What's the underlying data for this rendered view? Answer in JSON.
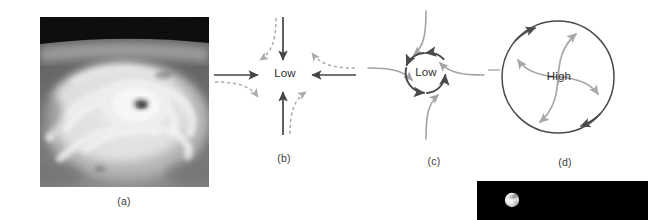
{
  "figure": {
    "background": "#ffffff",
    "width": 648,
    "height": 220
  },
  "panels": [
    {
      "id": "a",
      "caption": "(a)",
      "kind": "satellite-photograph",
      "description": "Grayscale satellite photograph of a mature hurricane with visible eye and spiral cloud bands, black band of space across the top",
      "colors": {
        "space": "#000000",
        "cloud": "#e8e8e8",
        "ocean": "#6b6b6b"
      }
    },
    {
      "id": "b",
      "caption": "(b)",
      "center_label": "Low",
      "kind": "pressure-gradient-diagram",
      "description": "Four straight solid arrows pointing inward toward a low pressure center, with gray dashed curved arrows showing Coriolis deflection",
      "colors": {
        "solid_arrow": "#404040",
        "dashed_arrow": "#a8a8a8"
      },
      "arrows": [
        {
          "from": "north",
          "direction": "inward",
          "style": "solid"
        },
        {
          "from": "south",
          "direction": "inward",
          "style": "solid"
        },
        {
          "from": "east",
          "direction": "inward",
          "style": "solid"
        },
        {
          "from": "west",
          "direction": "inward",
          "style": "solid"
        }
      ]
    },
    {
      "id": "c",
      "caption": "(c)",
      "center_label": "Low",
      "kind": "cyclonic-circulation-diagram",
      "description": "Small circle around a low pressure center with counterclockwise arrowheads on the ring and four gray curved inflow streamlines spiralling in",
      "rotation": "counterclockwise",
      "colors": {
        "ring": "#4a4a4a",
        "streamline": "#a0a0a0"
      }
    },
    {
      "id": "d",
      "caption": "(d)",
      "center_label": "High",
      "kind": "anticyclonic-circulation-diagram",
      "description": "Large circle around a high pressure center with clockwise arrowheads on the circumference and four gray curved outflow streamlines spiralling out",
      "rotation": "clockwise",
      "colors": {
        "ring": "#4a4a4a",
        "streamline": "#a0a0a0"
      }
    },
    {
      "id": "moon",
      "caption": "",
      "kind": "moon-photograph",
      "description": "Small bright moon sphere with dark mare patches on a black background panel",
      "colors": {
        "background": "#000000",
        "moon": "#f2f2f2",
        "mare": "#8a8a8a"
      }
    }
  ]
}
